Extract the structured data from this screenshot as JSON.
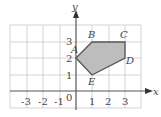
{
  "diagram": {
    "type": "coordinate-plane-polygon",
    "axes": {
      "x_label": "x",
      "y_label": "y",
      "origin_label": "0",
      "x_ticks": [
        "-3",
        "-2",
        "-1",
        "1",
        "2",
        "3"
      ],
      "y_ticks": [
        "1",
        "2",
        "3"
      ]
    },
    "grid": {
      "x_range": [
        -4,
        4
      ],
      "y_range": [
        -1,
        4
      ]
    },
    "polygon": {
      "fill": "#bdbdbd",
      "stroke": "#555555",
      "vertices": [
        {
          "label": "A",
          "x": 0,
          "y": 2
        },
        {
          "label": "B",
          "x": 1,
          "y": 3
        },
        {
          "label": "C",
          "x": 3,
          "y": 3
        },
        {
          "label": "D",
          "x": 3,
          "y": 2
        },
        {
          "label": "E",
          "x": 1,
          "y": 1
        }
      ]
    }
  }
}
